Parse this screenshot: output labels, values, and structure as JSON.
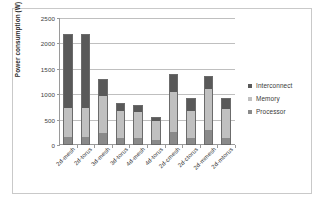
{
  "chart_data": {
    "type": "bar",
    "subtype": "stacked",
    "title": "",
    "xlabel": "",
    "ylabel": "Power consumption (W)",
    "ylim": [
      0,
      2500
    ],
    "yticks": [
      0,
      500,
      1000,
      1500,
      2000,
      2500
    ],
    "ytick_labels": [
      "0",
      "500",
      "1000",
      "1500",
      "2000",
      "2500"
    ],
    "grid": true,
    "legend_position": "right",
    "categories": [
      "2d-mesh",
      "2d-torus",
      "3d-mesh",
      "3d-torus",
      "4d-mesh",
      "4d-torus",
      "2d-cmesh",
      "2d-ctorus",
      "2d-mmesh",
      "2d-mtorus"
    ],
    "series": [
      {
        "name": "Processor",
        "color": "#8a8a8a",
        "values": [
          130,
          130,
          215,
          110,
          110,
          85,
          240,
          120,
          275,
          115
        ]
      },
      {
        "name": "Memory",
        "color": "#c0c0c0",
        "values": [
          570,
          570,
          725,
          545,
          515,
          375,
          780,
          535,
          800,
          570
        ]
      },
      {
        "name": "Interconnect",
        "color": "#595959",
        "values": [
          1450,
          1450,
          330,
          125,
          115,
          50,
          330,
          235,
          235,
          195
        ]
      }
    ],
    "totals": [
      2150,
      2150,
      1270,
      780,
      740,
      510,
      1350,
      890,
      1310,
      880
    ]
  },
  "legend": {
    "items": [
      {
        "label": "Interconnect",
        "color": "#595959"
      },
      {
        "label": "Memory",
        "color": "#c0c0c0"
      },
      {
        "label": "Processor",
        "color": "#8a8a8a"
      }
    ]
  }
}
